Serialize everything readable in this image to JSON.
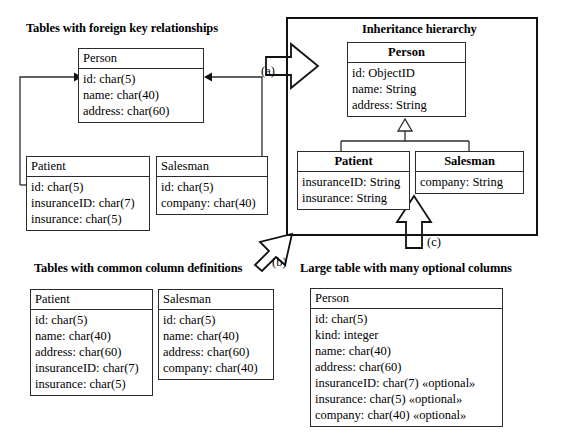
{
  "diagram": {
    "title_foreign_key": "Tables with foreign key relationships",
    "title_inheritance": "Inheritance hierarchy",
    "title_common_columns": "Tables with common column definitions",
    "title_optional_columns": "Large table with many optional columns",
    "arrow_labels": {
      "a": "(a)",
      "b": "(b)",
      "c": "(c)"
    },
    "colors": {
      "line": "#2b2b2b",
      "frame": "#111111",
      "text": "#000000",
      "background": "#ffffff"
    }
  },
  "fk_section": {
    "person": {
      "name": "Person",
      "attributes": [
        "id: char(5)",
        "name: char(40)",
        "address: char(60)"
      ]
    },
    "patient": {
      "name": "Patient",
      "attributes": [
        "id: char(5)",
        "insuranceID: char(7)",
        "insurance: char(5)"
      ]
    },
    "salesman": {
      "name": "Salesman",
      "attributes": [
        "id: char(5)",
        "company: char(40)"
      ]
    }
  },
  "inheritance_section": {
    "person": {
      "name": "Person",
      "attributes": [
        "id: ObjectID",
        "name: String",
        "address: String"
      ]
    },
    "patient": {
      "name": "Patient",
      "attributes": [
        "insuranceID: String",
        "insurance: String"
      ]
    },
    "salesman": {
      "name": "Salesman",
      "attributes": [
        "company: String"
      ]
    }
  },
  "common_columns_section": {
    "patient": {
      "name": "Patient",
      "attributes": [
        "id: char(5)",
        "name: char(40)",
        "address: char(60)",
        "insuranceID: char(7)",
        "insurance: char(5)"
      ]
    },
    "salesman": {
      "name": "Salesman",
      "attributes": [
        "id: char(5)",
        "name: char(40)",
        "address: char(60)",
        "company: char(40)"
      ]
    }
  },
  "optional_columns_section": {
    "person": {
      "name": "Person",
      "attributes": [
        "id: char(5)",
        "kind: integer",
        "name: char(40)",
        "address: char(60)",
        "insuranceID: char(7) «optional»",
        "insurance: char(5) «optional»",
        "company: char(40) «optional»"
      ]
    }
  }
}
